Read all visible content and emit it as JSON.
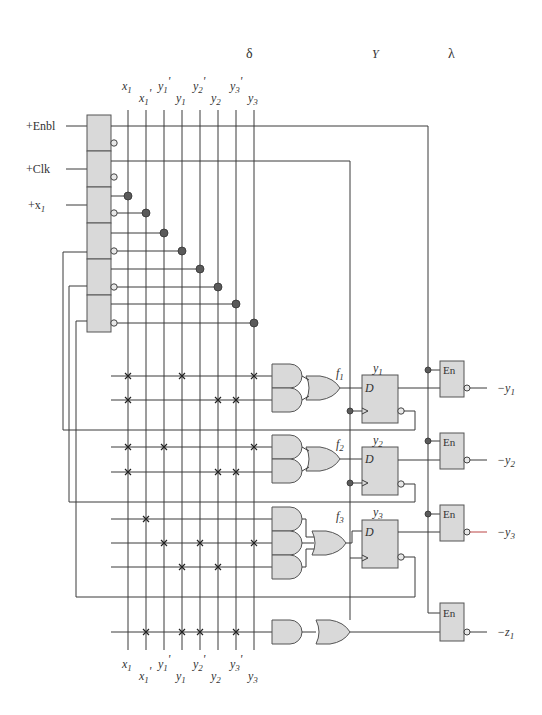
{
  "diagram": {
    "section_labels": {
      "delta": "δ",
      "Y": "Y",
      "lambda": "λ"
    },
    "column_labels": [
      {
        "main": "x",
        "sub": "1",
        "prime": ""
      },
      {
        "main": "x",
        "sub": "1",
        "prime": "'"
      },
      {
        "main": "y",
        "sub": "1",
        "prime": "'"
      },
      {
        "main": "y",
        "sub": "1",
        "prime": ""
      },
      {
        "main": "y",
        "sub": "2",
        "prime": "'"
      },
      {
        "main": "y",
        "sub": "2",
        "prime": ""
      },
      {
        "main": "y",
        "sub": "3",
        "prime": "'"
      },
      {
        "main": "y",
        "sub": "3",
        "prime": ""
      }
    ],
    "inputs": [
      {
        "label": "+Enbl"
      },
      {
        "label": "+Clk"
      },
      {
        "label": "+x",
        "sub": "1"
      }
    ],
    "functions": [
      {
        "label": "f",
        "sub": "1"
      },
      {
        "label": "f",
        "sub": "2"
      },
      {
        "label": "f",
        "sub": "3"
      }
    ],
    "flip_flops": [
      {
        "name": "y",
        "sub": "1",
        "d_label": "D"
      },
      {
        "name": "y",
        "sub": "2",
        "d_label": "D"
      },
      {
        "name": "y",
        "sub": "3",
        "d_label": "D"
      }
    ],
    "enable_buffers": [
      {
        "label": "En",
        "output": "−y",
        "sub": "1"
      },
      {
        "label": "En",
        "output": "−y",
        "sub": "2"
      },
      {
        "label": "En",
        "output": "−y",
        "sub": "3"
      },
      {
        "label": "En",
        "output": "−z",
        "sub": "1"
      }
    ],
    "product_terms": [
      {
        "row": "f1-a",
        "columns": [
          "x1",
          "y1",
          "y3"
        ]
      },
      {
        "row": "f1-b",
        "columns": [
          "x1",
          "y2",
          "y3'"
        ]
      },
      {
        "row": "f2-a",
        "columns": [
          "x1",
          "y1'",
          "y3"
        ]
      },
      {
        "row": "f2-b",
        "columns": [
          "x1",
          "y2",
          "y3'"
        ]
      },
      {
        "row": "f3-a",
        "columns": [
          "x1'"
        ]
      },
      {
        "row": "f3-b",
        "columns": [
          "y1'",
          "y2'",
          "y3"
        ]
      },
      {
        "row": "f3-c",
        "columns": [
          "y1",
          "y2"
        ]
      },
      {
        "row": "z1",
        "columns": [
          "x1'",
          "y1",
          "y2'",
          "y3'"
        ]
      }
    ]
  }
}
